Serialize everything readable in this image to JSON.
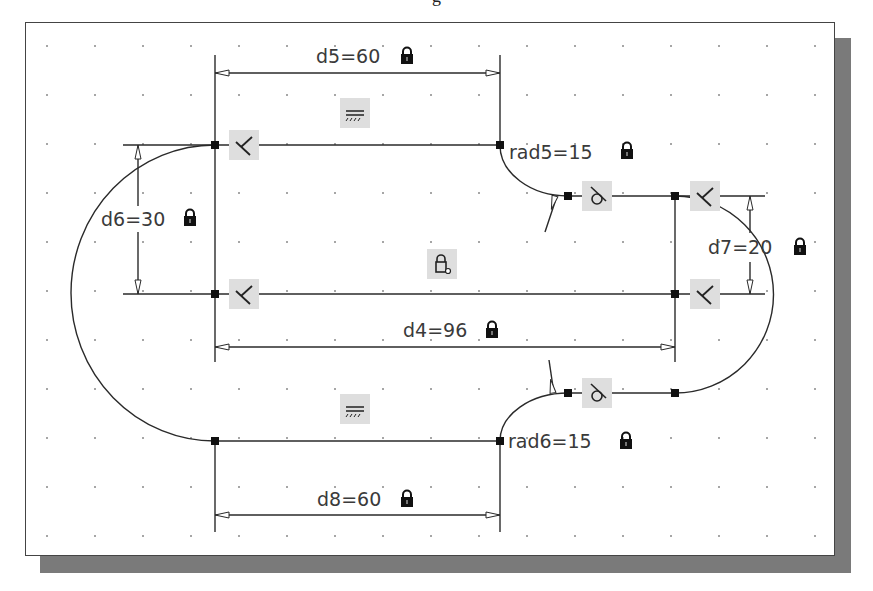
{
  "caption": {
    "text": "g"
  },
  "colors": {
    "line": "#2a2a2a",
    "shadow": "#7a7a7a",
    "constraint_bg": "#dedede",
    "grid_dot": "#888888"
  },
  "dimensions": {
    "d5": {
      "label": "d5=60",
      "locked": true
    },
    "d6": {
      "label": "d6=30",
      "locked": true
    },
    "d7": {
      "label": "d7=20",
      "locked": true
    },
    "d4": {
      "label": "d4=96",
      "locked": true
    },
    "d8": {
      "label": "d8=60",
      "locked": true
    },
    "rad5": {
      "label": "rad5=15",
      "locked": true
    },
    "rad6": {
      "label": "rad6=15",
      "locked": true
    }
  },
  "constraints": [
    {
      "type": "parallel",
      "icon": "parallel-icon"
    },
    {
      "type": "parallel",
      "icon": "parallel-icon"
    },
    {
      "type": "perpendicular",
      "icon": "perpendicular-icon"
    },
    {
      "type": "tangent",
      "icon": "tangent-icon"
    },
    {
      "type": "fix",
      "icon": "fix-lock-icon"
    }
  ]
}
